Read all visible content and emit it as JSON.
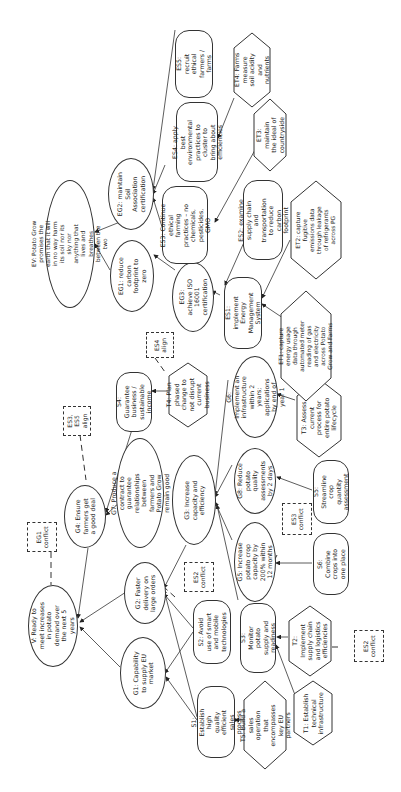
{
  "diagram": {
    "orientation": "rotated -90deg (text reads bottom-to-top)",
    "vision": {
      "V": "V: Ready to meet increases in potato demand over the next 5 years",
      "EV": "EV: Potato Grow promises the earth that it will in no way harm its soil nor its sky nor anything that lives and breathes between the two"
    },
    "goals": {
      "G1": "G1: Capability to supply EU market",
      "G2": "G2: Faster delivery on large orders",
      "G3": "G3: Increase capacity and efficiency",
      "G4": "G4: Ensure farmers get a good deal",
      "G5": "G5: Increase potato crop capacity by 200% within 12 months",
      "G6": "G6: Implement an infrastructure within 2 years; applications by end of year 1",
      "G7": "G7: Produce a contract to guarantee relationships between farmers and Potato Grow remain good",
      "G8": "G8: Reduce potato quality assessments by 2 days",
      "EG1": "EG1: reduce carbon footprint to zero",
      "EG2": "EG2: maintain Soil Association certification",
      "EG3": "EG3: achieve ISO 16001 certification"
    },
    "strategies": {
      "S1": "S1: Establish high quality efficient sales process",
      "S2": "S2: Avoid use of smart and mobile technologies",
      "S3": "S3: Monitor potato supply and readiness",
      "S4": "S4: Guarantee business / sustainable income",
      "S5": "S5: Streamline crop quantity assessment",
      "S6": "S6: Combine crops into one place",
      "ES1": "ES1: implement Energy Management System",
      "ES2": "ES2: examine supply chain and transportation to reduce carbon footprint",
      "ES3": "ES3: Continue ethical farming practices – no chemicals, pesticides, GMO",
      "ES4": "ES4: apply best environmental practices to cluster to bring about efficiencies",
      "ES5": "ES5: recruit ethical farmers / farms"
    },
    "tactics": {
      "T1": "T1: Establish technical infrastructure",
      "T2": "T2: Implement supply chain and logistics efficiencies",
      "T3": "T3: Assess current process for entire potato lifecycle",
      "T4": "T4: Plan phased change to not disrupt current business",
      "T5": "T5: Build a sales operation that encompasses key EU partners",
      "ET1": "ET1: capture energy usage data through automated meter reading of gas and electricity across Potato Grow and Farms",
      "ET2": "ET2: capture fugitive emissions data through leakage of refrigerants across PG",
      "ET3": "ET3: maintain the ideal of countryside",
      "ET4": "ET4: Farms measure soil acidity and nutrients"
    },
    "annotations": {
      "eg1_conflict": "EG1 conflict",
      "es3_es5_align": "ES3, ES5 align",
      "es4_align": "ES4 align",
      "es2_conflict_g2": "ES2 conflict",
      "es3_conflict_g5": "ES3 conflict",
      "es2_conflict_t2": "ES2 conflict"
    },
    "colors": {
      "line": "#333333",
      "fill": "#ffffff",
      "text": "#222222"
    }
  }
}
